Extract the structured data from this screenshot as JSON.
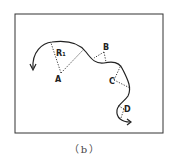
{
  "figure": {
    "caption": "（b）",
    "labels": {
      "A": "A",
      "R": "R₁",
      "B": "B",
      "C": "C",
      "D": "D"
    },
    "colors": {
      "line": "#222222",
      "frame": "#333333",
      "background": "#ffffff"
    }
  }
}
